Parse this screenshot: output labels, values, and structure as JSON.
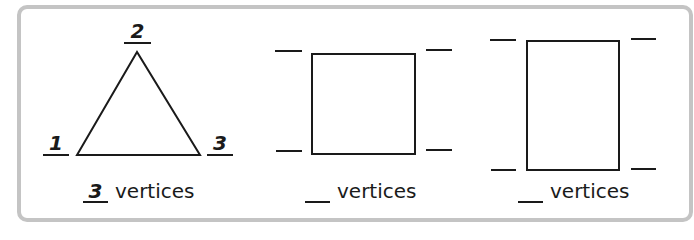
{
  "worksheet": {
    "shapes": [
      {
        "name": "triangle",
        "vertex_labels": [
          "1",
          "2",
          "3"
        ],
        "count_answer": "3",
        "count_label": "vertices"
      },
      {
        "name": "square",
        "vertex_labels": [
          "",
          "",
          "",
          ""
        ],
        "count_answer": "",
        "count_label": "vertices"
      },
      {
        "name": "rectangle",
        "vertex_labels": [
          "",
          "",
          "",
          ""
        ],
        "count_answer": "",
        "count_label": "vertices"
      }
    ],
    "colors": {
      "frame_border": "#c4c4c4",
      "ink": "#1a1a1a",
      "background": "#ffffff"
    }
  }
}
